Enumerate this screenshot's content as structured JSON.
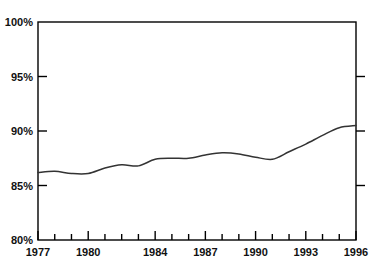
{
  "chart_data": {
    "type": "line",
    "title": "",
    "subtitle": "",
    "xlabel": "",
    "ylabel": "",
    "xlim": [
      1977,
      1996
    ],
    "ylim": [
      80,
      100
    ],
    "grid": false,
    "legend": null,
    "y_tick_labels": [
      "80%",
      "85%",
      "90%",
      "95%",
      "100%"
    ],
    "y_ticks": [
      80,
      85,
      90,
      95,
      100
    ],
    "x_tick_labels": [
      "1977",
      "1980",
      "1984",
      "1987",
      "1990",
      "1993",
      "1996"
    ],
    "x_ticks": [
      1977,
      1980,
      1984,
      1987,
      1990,
      1993,
      1996
    ],
    "x_minor_ticks": [
      1978,
      1979,
      1981,
      1982,
      1983,
      1985,
      1986,
      1988,
      1989,
      1991,
      1992,
      1994,
      1995
    ],
    "line_color": "#333333",
    "axis_color": "#000000",
    "background_color": "#ffffff",
    "x": [
      1977,
      1978,
      1979,
      1980,
      1981,
      1982,
      1983,
      1984,
      1985,
      1986,
      1987,
      1988,
      1989,
      1990,
      1991,
      1992,
      1993,
      1994,
      1995,
      1996
    ],
    "values": [
      86.2,
      86.3,
      86.1,
      86.1,
      86.6,
      86.9,
      86.8,
      87.4,
      87.5,
      87.5,
      87.8,
      88.0,
      87.9,
      87.6,
      87.4,
      88.1,
      88.8,
      89.6,
      90.3,
      90.5
    ],
    "series": [
      {
        "name": "",
        "values": [
          86.2,
          86.3,
          86.1,
          86.1,
          86.6,
          86.9,
          86.8,
          87.4,
          87.5,
          87.5,
          87.8,
          88.0,
          87.9,
          87.6,
          87.4,
          88.1,
          88.8,
          89.6,
          90.3,
          90.5
        ]
      }
    ]
  },
  "geometry": {
    "plot_left": 38,
    "plot_right": 356,
    "plot_top": 22,
    "plot_bottom": 240
  }
}
